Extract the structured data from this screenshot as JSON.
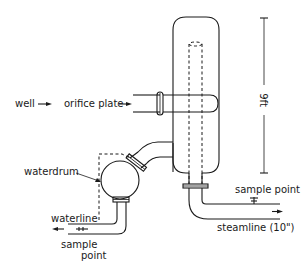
{
  "diagram": {
    "type": "process-schematic",
    "colors": {
      "line": "#1a1a1a",
      "background": "#ffffff"
    },
    "labels": {
      "well": "well",
      "orifice_plate": "orifice plate",
      "waterdrum": "waterdrum",
      "waterline": "waterline",
      "sample_point_water_1": "sample",
      "sample_point_water_2": "point",
      "sample_point_steam": "sample point",
      "steamline": "steamline (10\")",
      "height_dimension": "9ft"
    },
    "components": [
      {
        "id": "separator-vessel",
        "label": "separator vessel"
      },
      {
        "id": "inlet-pipe",
        "label": "inlet pipe from well via orifice plate"
      },
      {
        "id": "waterdrum",
        "label": "waterdrum"
      },
      {
        "id": "steam-outlet",
        "label": "steamline (10\")"
      },
      {
        "id": "water-outlet",
        "label": "waterline"
      }
    ]
  }
}
